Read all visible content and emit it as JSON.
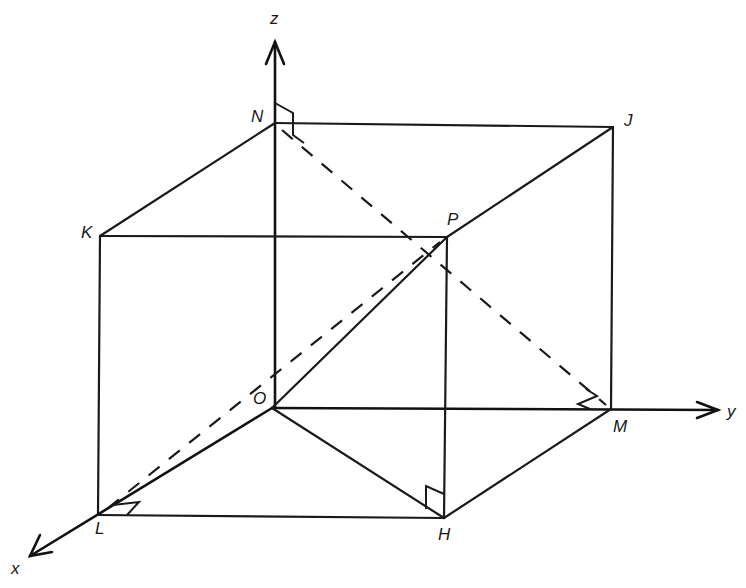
{
  "diagram": {
    "type": "3d-cuboid-coordinate-diagram",
    "axes": {
      "x": {
        "label": "x"
      },
      "y": {
        "label": "y"
      },
      "z": {
        "label": "z"
      }
    },
    "points": {
      "O": {
        "label": "O"
      },
      "N": {
        "label": "N"
      },
      "J": {
        "label": "J"
      },
      "K": {
        "label": "K"
      },
      "P": {
        "label": "P"
      },
      "M": {
        "label": "M"
      },
      "L": {
        "label": "L"
      },
      "H": {
        "label": "H"
      }
    },
    "solid_edges": [
      "O-N",
      "N-J",
      "J-M",
      "O-M",
      "N-K",
      "K-P",
      "P-J",
      "K-L",
      "L-H",
      "H-M",
      "P-H",
      "O-L",
      "O-H",
      "O-P"
    ],
    "dashed_lines": [
      "N-M",
      "L-P"
    ],
    "right_angle_marks": [
      "N",
      "M",
      "H",
      "L"
    ],
    "colors": {
      "stroke": "#1a1a1a",
      "background": "#ffffff"
    }
  }
}
